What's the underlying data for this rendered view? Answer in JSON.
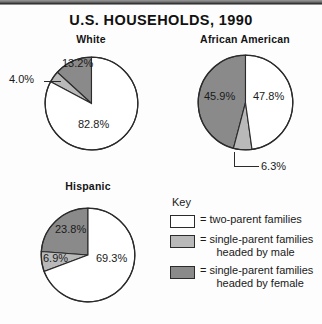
{
  "figure": {
    "title": "U.S. HOUSEHOLDS, 1990"
  },
  "colors": {
    "two_parent": "#ffffff",
    "single_male": "#b9b9b9",
    "single_female": "#8a8a8a",
    "outline": "#2b2b2b",
    "text": "#1a1a1a"
  },
  "key": {
    "heading": "Key",
    "equals": "=",
    "items": [
      {
        "swatch": "two-parent-swatch",
        "color": "#ffffff",
        "label_line1": "two-parent families",
        "label_line2": ""
      },
      {
        "swatch": "single-parent-male-swatch",
        "color": "#b9b9b9",
        "label_line1": "single-parent families",
        "label_line2": "headed by male"
      },
      {
        "swatch": "single-parent-female-swatch",
        "color": "#8a8a8a",
        "label_line1": "single-parent families",
        "label_line2": "headed by female"
      }
    ]
  },
  "chart_data": {
    "type": "pie",
    "title": "U.S. HOUSEHOLDS, 1990",
    "legend_position": "bottom-right",
    "legend": [
      "two-parent families",
      "single-parent families headed by male",
      "single-parent families headed by female"
    ],
    "charts": [
      {
        "name": "White",
        "categories": [
          "two-parent families",
          "single-parent families headed by male",
          "single-parent families headed by female"
        ],
        "values": [
          82.8,
          4.0,
          13.2
        ],
        "labels": [
          "82.8%",
          "4.0%",
          "13.2%"
        ]
      },
      {
        "name": "African American",
        "categories": [
          "two-parent families",
          "single-parent families headed by male",
          "single-parent families headed by female"
        ],
        "values": [
          47.8,
          6.3,
          45.9
        ],
        "labels": [
          "47.8%",
          "6.3%",
          "45.9%"
        ]
      },
      {
        "name": "Hispanic",
        "categories": [
          "two-parent families",
          "single-parent families headed by male",
          "single-parent families headed by female"
        ],
        "values": [
          69.3,
          6.9,
          23.8
        ],
        "labels": [
          "69.3%",
          "6.9%",
          "23.8%"
        ]
      }
    ]
  }
}
